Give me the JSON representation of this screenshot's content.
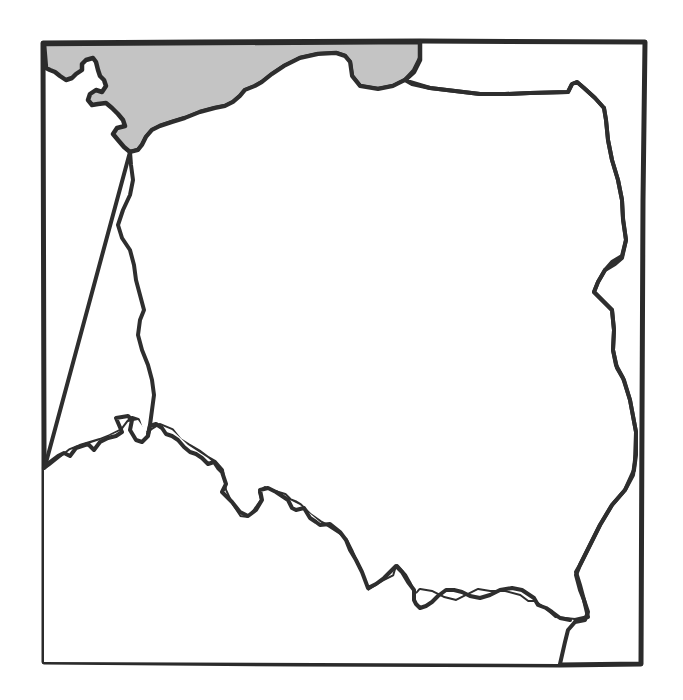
{
  "map": {
    "subject": "Outline map of Poland",
    "style": "hand-drawn black outline",
    "regions": [
      {
        "name": "Poland",
        "fill": "#ffffff"
      },
      {
        "name": "Baltic Sea",
        "fill": "#c4c4c4"
      }
    ],
    "colors": {
      "stroke": "#2e2e2e",
      "sea": "#c4c4c4",
      "land": "#ffffff"
    }
  }
}
